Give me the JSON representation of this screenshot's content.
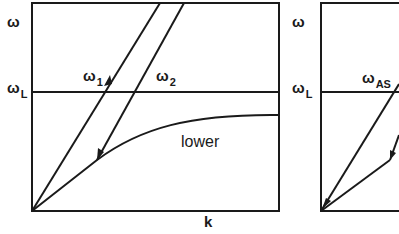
{
  "figure": {
    "panels": [
      {
        "id": "left",
        "y_axis_label": "ω",
        "wl_label": {
          "main": "ω",
          "sub": "L"
        },
        "x_axis_label": "k",
        "curve_labels": [
          {
            "main": "ω",
            "sub": "1"
          },
          {
            "main": "ω",
            "sub": "2"
          }
        ],
        "region_label": "lower"
      },
      {
        "id": "right",
        "y_axis_label": "ω",
        "wl_label": {
          "main": "ω",
          "sub": "L"
        },
        "curve_labels": [
          {
            "main": "ω",
            "sub": "AS"
          }
        ]
      }
    ],
    "colors": {
      "line": "#1a1a1a",
      "background": "#ffffff"
    }
  }
}
